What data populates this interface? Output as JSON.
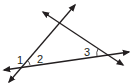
{
  "diagram": {
    "type": "geometry-lines-triangle",
    "stroke_color": "#231f20",
    "background": "#ffffff",
    "lines": [
      {
        "id": "line-a",
        "from": [
          9,
          82
        ],
        "to": [
          75,
          5
        ],
        "arrows": "both"
      },
      {
        "id": "line-b",
        "from": [
          43,
          12
        ],
        "to": [
          123,
          65
        ],
        "arrows": "both"
      },
      {
        "id": "line-c",
        "from": [
          4,
          70
        ],
        "to": [
          129,
          52
        ],
        "arrows": "both"
      }
    ],
    "angle_labels": [
      {
        "label": "1",
        "x": 19,
        "y": 63
      },
      {
        "label": "2",
        "x": 37,
        "y": 63
      },
      {
        "label": "3",
        "x": 84,
        "y": 56
      }
    ]
  }
}
